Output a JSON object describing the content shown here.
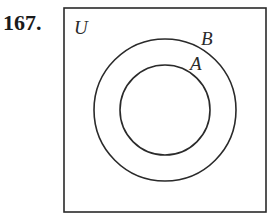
{
  "problem_number": "167.",
  "diagram": {
    "type": "venn",
    "universe_label": "U",
    "sets": [
      {
        "name": "B",
        "relation": "outer circle"
      },
      {
        "name": "A",
        "relation": "inner circle, subset of B"
      }
    ]
  },
  "colors": {
    "stroke": "#2a2a2a",
    "background": "#ffffff"
  }
}
